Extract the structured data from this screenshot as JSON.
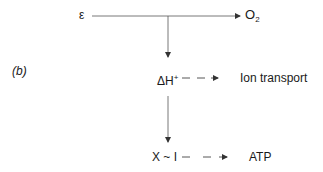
{
  "panel_label": "(b)",
  "nodes": {
    "epsilon": {
      "text": "ε"
    },
    "oxygen": {
      "base": "O",
      "subscript": "2"
    },
    "proton_gradient": {
      "base": "ΔH",
      "superscript": "+"
    },
    "ion_transport": {
      "text": "Ion transport"
    },
    "intermediate": {
      "text": "X ~ I"
    },
    "atp": {
      "text": "ATP"
    }
  },
  "edges": [
    {
      "from": "epsilon",
      "to": "oxygen",
      "style": "solid"
    },
    {
      "from": "epsilon-line",
      "to": "proton_gradient",
      "style": "solid"
    },
    {
      "from": "proton_gradient",
      "to": "ion_transport",
      "style": "dashed"
    },
    {
      "from": "proton_gradient",
      "to": "intermediate",
      "style": "solid"
    },
    {
      "from": "intermediate",
      "to": "atp",
      "style": "dashed"
    }
  ],
  "colors": {
    "line": "#333333",
    "text": "#1a1a1a"
  }
}
